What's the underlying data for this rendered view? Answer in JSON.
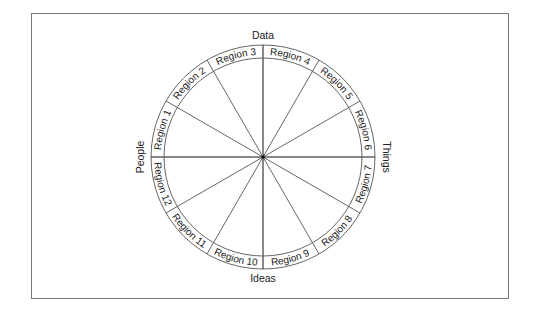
{
  "diagram": {
    "type": "circular-wheel",
    "axes": {
      "top": "Data",
      "bottom": "Ideas",
      "left": "People",
      "right": "Things"
    },
    "regions": [
      {
        "label": "Region 1",
        "start_deg": 270,
        "end_deg": 300
      },
      {
        "label": "Region 2",
        "start_deg": 300,
        "end_deg": 330
      },
      {
        "label": "Region 3",
        "start_deg": 330,
        "end_deg": 360
      },
      {
        "label": "Region 4",
        "start_deg": 0,
        "end_deg": 30
      },
      {
        "label": "Region 5",
        "start_deg": 30,
        "end_deg": 60
      },
      {
        "label": "Region 6",
        "start_deg": 60,
        "end_deg": 90
      },
      {
        "label": "Region 7",
        "start_deg": 90,
        "end_deg": 120
      },
      {
        "label": "Region 8",
        "start_deg": 120,
        "end_deg": 150
      },
      {
        "label": "Region 9",
        "start_deg": 150,
        "end_deg": 180
      },
      {
        "label": "Region 10",
        "start_deg": 180,
        "end_deg": 210
      },
      {
        "label": "Region 11",
        "start_deg": 210,
        "end_deg": 240
      },
      {
        "label": "Region 12",
        "start_deg": 240,
        "end_deg": 270
      }
    ],
    "colors": {
      "line": "#555555",
      "text": "#222222",
      "frame": "#777777",
      "background": "#ffffff"
    }
  }
}
